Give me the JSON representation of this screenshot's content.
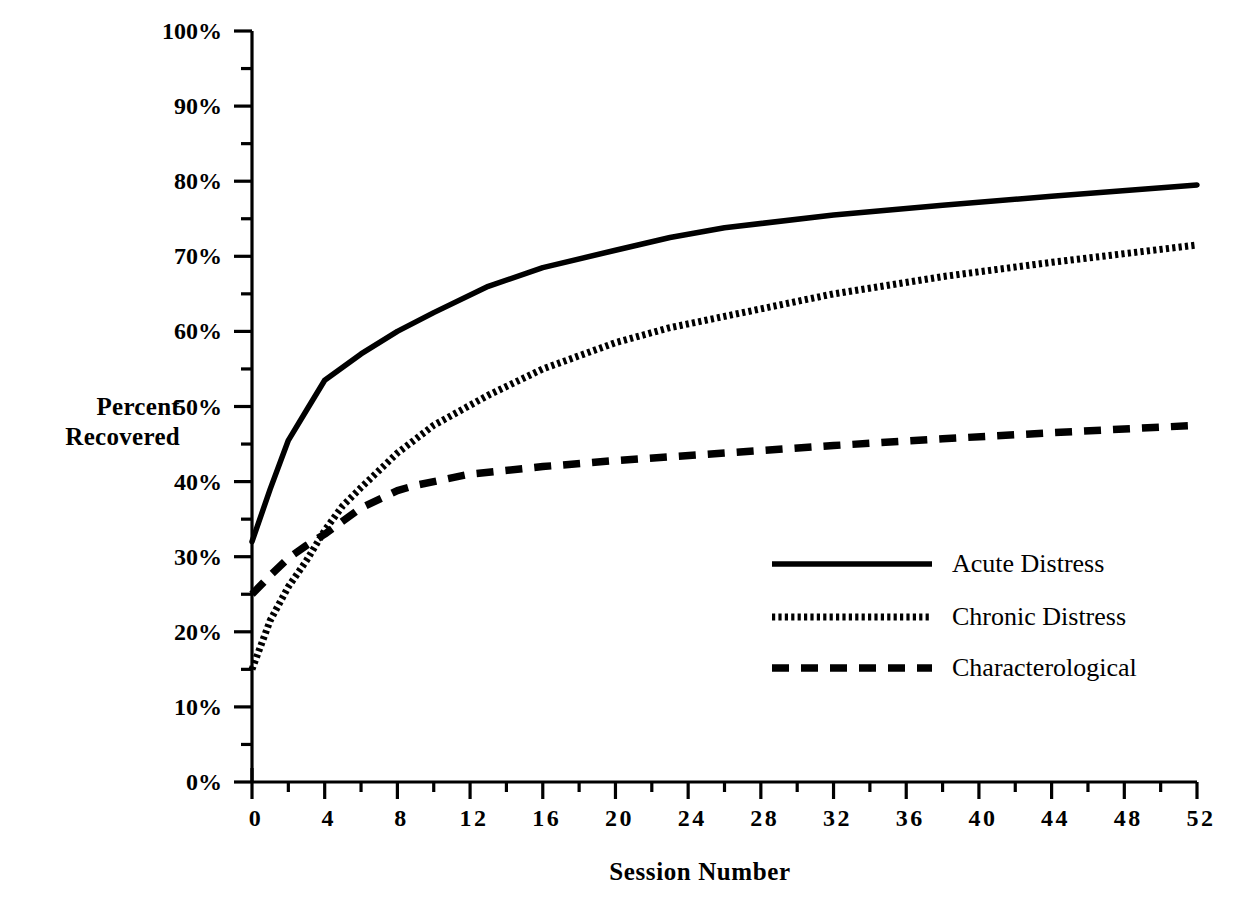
{
  "chart_data": {
    "type": "line",
    "title": "",
    "xlabel": "Session  Number",
    "ylabel": "Percent\nRecovered",
    "ylabel_line1": "Percent",
    "ylabel_line2": "Recovered",
    "xlim": [
      0,
      52
    ],
    "ylim": [
      0,
      100
    ],
    "grid": false,
    "legend_position": "center-right",
    "x_ticks_major": [
      0,
      4,
      8,
      12,
      16,
      20,
      24,
      28,
      32,
      36,
      40,
      44,
      48,
      52
    ],
    "x_tick_labels": [
      "0",
      "4",
      "8",
      "12",
      "16",
      "20",
      "24",
      "28",
      "32",
      "36",
      "40",
      "44",
      "48",
      "52"
    ],
    "x_ticks_minor": [
      2,
      6,
      10,
      14,
      18,
      22,
      26,
      30,
      34,
      38,
      42,
      46,
      50
    ],
    "y_ticks_major": [
      0,
      10,
      20,
      30,
      40,
      50,
      60,
      70,
      80,
      90,
      100
    ],
    "y_tick_labels": [
      "0%",
      "10%",
      "20%",
      "30%",
      "40%",
      "50%",
      "60%",
      "70%",
      "80%",
      "90%",
      "100%"
    ],
    "y_ticks_minor": [
      5,
      15,
      25,
      35,
      45,
      55,
      65,
      75,
      85,
      95
    ],
    "series": [
      {
        "name": "Acute Distress",
        "style": "solid",
        "color": "#000000",
        "x": [
          0,
          1,
          2,
          3,
          4,
          6,
          8,
          10,
          13,
          16,
          20,
          23,
          26,
          32,
          38,
          44,
          52
        ],
        "values": [
          32,
          39,
          45.5,
          49.5,
          53.5,
          57,
          60,
          62.5,
          66,
          68.5,
          70.8,
          72.5,
          73.8,
          75.5,
          76.8,
          78,
          79.5
        ]
      },
      {
        "name": "Chronic Distress",
        "style": "dotted",
        "color": "#000000",
        "x": [
          0,
          1,
          2,
          3,
          4,
          5,
          6,
          8,
          10,
          13,
          16,
          20,
          23,
          26,
          32,
          38,
          44,
          52
        ],
        "values": [
          15,
          21.5,
          26,
          29.5,
          33.5,
          36.8,
          39.2,
          43.8,
          47.5,
          51.5,
          55,
          58.5,
          60.5,
          62,
          65,
          67.3,
          69.2,
          71.5
        ]
      },
      {
        "name": "Characterological",
        "style": "dashed",
        "color": "#000000",
        "x": [
          0,
          1,
          2,
          3,
          4,
          6,
          8,
          9,
          12,
          16,
          20,
          26,
          32,
          38,
          44,
          52
        ],
        "values": [
          25,
          27.5,
          29.8,
          31.5,
          33,
          36.5,
          38.8,
          39.5,
          41,
          42,
          42.8,
          43.8,
          44.8,
          45.7,
          46.5,
          47.5
        ]
      }
    ]
  },
  "legend": {
    "items": [
      {
        "label": "Acute Distress",
        "style": "solid"
      },
      {
        "label": "Chronic Distress",
        "style": "dotted"
      },
      {
        "label": "Characterological",
        "style": "dashed"
      }
    ]
  }
}
